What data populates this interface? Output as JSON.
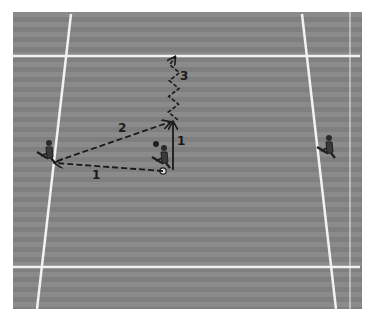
{
  "diagram": {
    "type": "sports-play-diagram",
    "field": {
      "stripe_colors": [
        "#8b8b8b",
        "#7f7f7f"
      ],
      "line_color": "#f2f2f2",
      "lines": [
        {
          "name": "top-line",
          "x1": 13,
          "y1": 56,
          "x2": 360,
          "y2": 56
        },
        {
          "name": "bottom-line",
          "x1": 13,
          "y1": 267,
          "x2": 360,
          "y2": 267
        },
        {
          "name": "left-sideline",
          "x1": 71,
          "y1": 14,
          "x2": 37,
          "y2": 309
        },
        {
          "name": "right-sideline",
          "x1": 302,
          "y1": 14,
          "x2": 336,
          "y2": 309
        },
        {
          "name": "right-edge-line",
          "x1": 350,
          "y1": 12,
          "x2": 350,
          "y2": 309
        }
      ]
    },
    "players": [
      {
        "name": "left-player",
        "x": 45,
        "y": 153
      },
      {
        "name": "center-player-with-ball",
        "x": 160,
        "y": 158
      },
      {
        "name": "right-player",
        "x": 325,
        "y": 148
      }
    ],
    "arrows": [
      {
        "label": "1",
        "style": "dashed",
        "from": [
          163,
          171
        ],
        "to": [
          55,
          163
        ]
      },
      {
        "label": "2",
        "style": "dashed",
        "from": [
          57,
          161
        ],
        "to": [
          170,
          122
        ]
      },
      {
        "label": "1",
        "style": "solid",
        "from": [
          173,
          170
        ],
        "to": [
          173,
          122
        ]
      },
      {
        "label": "3",
        "style": "zigzag",
        "from": [
          173,
          120
        ],
        "to": [
          175,
          57
        ]
      }
    ],
    "labels": [
      {
        "text": "1",
        "x": 92,
        "y": 169
      },
      {
        "text": "2",
        "x": 118,
        "y": 122
      },
      {
        "text": "1",
        "x": 177,
        "y": 135
      },
      {
        "text": "3",
        "x": 180,
        "y": 70
      }
    ]
  }
}
